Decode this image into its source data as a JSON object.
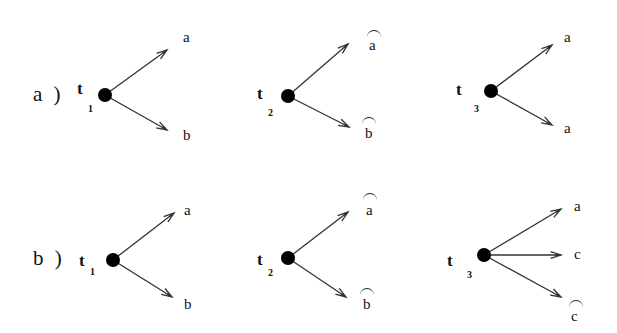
{
  "rows": [
    {
      "label": "a )",
      "trees": [
        {
          "var": "t",
          "sub": "1",
          "node": [
            105,
            95
          ],
          "branches": [
            {
              "tip": [
                167,
                50
              ],
              "label": "a",
              "hat": false,
              "lx": 183,
              "ly": 30
            },
            {
              "tip": [
                167,
                130
              ],
              "label": "b",
              "hat": false,
              "lx": 183,
              "ly": 128
            }
          ]
        },
        {
          "var": "t",
          "sub": "2",
          "node": [
            288,
            96
          ],
          "branches": [
            {
              "tip": [
                348,
                44
              ],
              "label": "a",
              "hat": true,
              "lx": 369,
              "ly": 36
            },
            {
              "tip": [
                349,
                127
              ],
              "label": "b",
              "hat": true,
              "lx": 365,
              "ly": 127
            }
          ]
        },
        {
          "var": "t",
          "sub": "3",
          "node": [
            491,
            91
          ],
          "branches": [
            {
              "tip": [
                552,
                45
              ],
              "label": "a",
              "hat": false,
              "lx": 564,
              "ly": 30
            },
            {
              "tip": [
                552,
                125
              ],
              "label": "a",
              "hat": false,
              "lx": 564,
              "ly": 122
            }
          ]
        }
      ]
    },
    {
      "label": "b )",
      "trees": [
        {
          "var": "t",
          "sub": "1",
          "node": [
            113,
            260
          ],
          "branches": [
            {
              "tip": [
                174,
                213
              ],
              "label": "a",
              "hat": false,
              "lx": 184,
              "ly": 203
            },
            {
              "tip": [
                172,
                297
              ],
              "label": "b",
              "hat": false,
              "lx": 184,
              "ly": 297
            }
          ]
        },
        {
          "var": "t",
          "sub": "2",
          "node": [
            288,
            258
          ],
          "branches": [
            {
              "tip": [
                348,
                212
              ],
              "label": "a",
              "hat": true,
              "lx": 366,
              "ly": 204
            },
            {
              "tip": [
                346,
                297
              ],
              "label": "b",
              "hat": true,
              "lx": 363,
              "ly": 298
            }
          ]
        },
        {
          "var": "t",
          "sub": "3",
          "node": [
            484,
            255
          ],
          "branches": [
            {
              "tip": [
                561,
                209
              ],
              "label": "a",
              "hat": false,
              "lx": 574,
              "ly": 199
            },
            {
              "tip": [
                561,
                255
              ],
              "label": "c",
              "hat": false,
              "lx": 574,
              "ly": 247
            },
            {
              "tip": [
                561,
                297
              ],
              "label": "c",
              "hat": true,
              "lx": 571,
              "ly": 297
            }
          ]
        }
      ]
    }
  ],
  "colors": {
    "stroke": "#333333",
    "node": "#000000",
    "background": "#ffffff"
  }
}
